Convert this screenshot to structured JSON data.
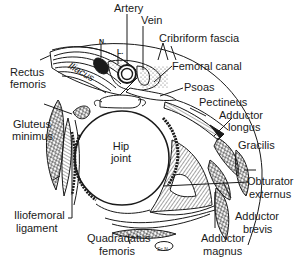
{
  "figure": {
    "labels": {
      "artery": "Artery",
      "vein": "Vein",
      "nerve": "N.",
      "lymphatic": "L.",
      "cribriform_fascia": "Cribriform fascia",
      "femoral_canal": "Femoral canal",
      "iliacus": "Iliacus",
      "psoas": "Psoas",
      "pectineus": "Pectineus",
      "adductor_longus_1": "Adductor",
      "adductor_longus_2": "longus",
      "rectus_femoris_1": "Rectus",
      "rectus_femoris_2": "femoris",
      "gluteus_minimus_1": "Gluteus",
      "gluteus_minimus_2": "minimus",
      "hip_joint_1": "Hip",
      "hip_joint_2": "joint",
      "gracilis": "Gracilis",
      "obturator_externus_1": "Obturator",
      "obturator_externus_2": "externus",
      "iliofemoral_ligament_1": "Iliofemoral",
      "iliofemoral_ligament_2": "ligament",
      "quadradatus_femoris_1": "Quadradatus",
      "quadradatus_femoris_2": "femoris",
      "adductor_brevis_1": "Adductor",
      "adductor_brevis_2": "brevis",
      "adductor_magnus_1": "Adductor",
      "adductor_magnus_2": "magnus",
      "sciatic_nerve": "Sc.N."
    },
    "colors": {
      "ink": "#1a1a1a",
      "background": "#ffffff"
    }
  }
}
